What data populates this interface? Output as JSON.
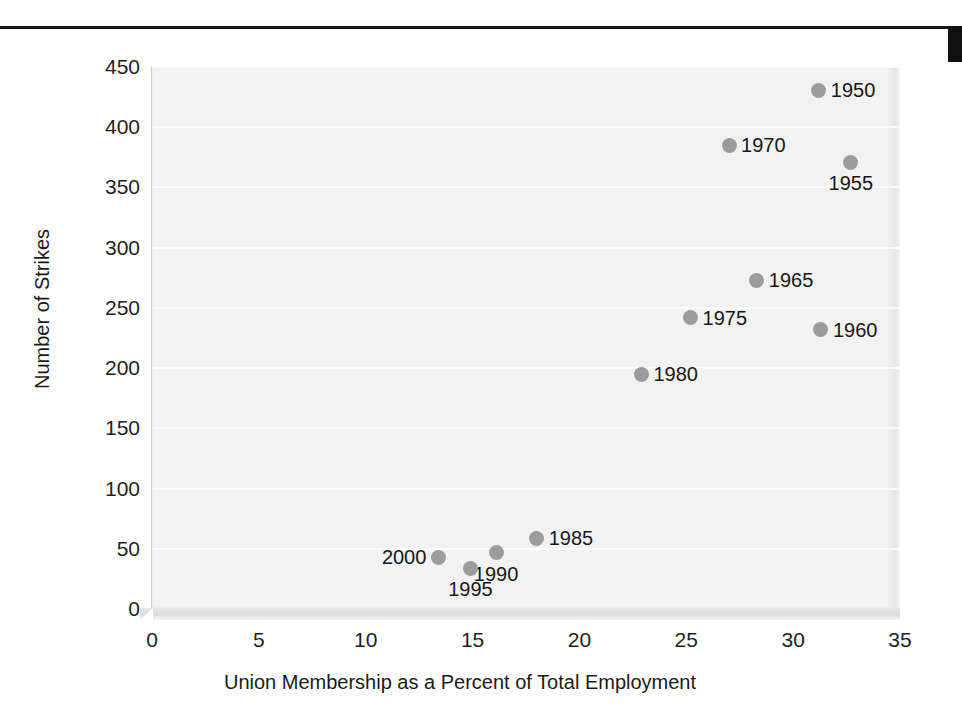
{
  "figure": {
    "top_rule": "horizontal-rule",
    "right_mark": "page-edge-mark"
  },
  "chart_data": {
    "type": "scatter",
    "title": "",
    "xlabel": "Union Membership as a Percent of Total Employment",
    "ylabel": "Number of Strikes",
    "xlim": [
      0,
      35
    ],
    "ylim": [
      0,
      450
    ],
    "xticks": [
      "0",
      "5",
      "10",
      "15",
      "20",
      "25",
      "30",
      "35"
    ],
    "yticks": [
      "0",
      "50",
      "100",
      "150",
      "200",
      "250",
      "300",
      "350",
      "400",
      "450"
    ],
    "grid": "horizontal",
    "legend": "none",
    "marker_color": "#9c9c9c",
    "plot_background": "#f2f2f2",
    "points": [
      {
        "label": "1950",
        "x": 31.2,
        "y": 430,
        "label_pos": "right"
      },
      {
        "label": "1955",
        "x": 32.7,
        "y": 370,
        "label_pos": "below"
      },
      {
        "label": "1960",
        "x": 31.3,
        "y": 231,
        "label_pos": "right"
      },
      {
        "label": "1965",
        "x": 28.3,
        "y": 272,
        "label_pos": "right"
      },
      {
        "label": "1970",
        "x": 27.0,
        "y": 384,
        "label_pos": "right"
      },
      {
        "label": "1975",
        "x": 25.2,
        "y": 241,
        "label_pos": "right"
      },
      {
        "label": "1980",
        "x": 22.9,
        "y": 194,
        "label_pos": "right"
      },
      {
        "label": "1985",
        "x": 18.0,
        "y": 58,
        "label_pos": "right"
      },
      {
        "label": "1990",
        "x": 16.1,
        "y": 46,
        "label_pos": "below"
      },
      {
        "label": "1995",
        "x": 14.9,
        "y": 33,
        "label_pos": "below"
      },
      {
        "label": "2000",
        "x": 13.4,
        "y": 42,
        "label_pos": "left"
      }
    ]
  }
}
